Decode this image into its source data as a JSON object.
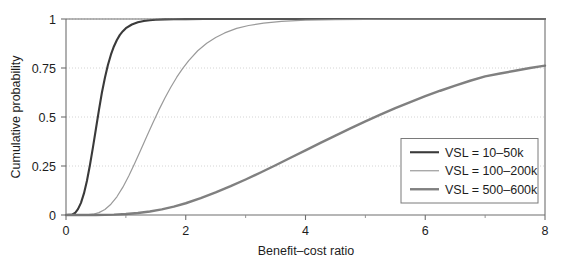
{
  "figure": {
    "background_color": "#ffffff",
    "plot_frame_color": "#6f6f6f",
    "grid_color": "#c9c9c9"
  },
  "chart_data": {
    "type": "line",
    "title": "",
    "subtitle": "",
    "xlabel": "Benefit–cost ratio",
    "ylabel": "Cumulative probability",
    "xlim": [
      0,
      8
    ],
    "ylim": [
      0,
      1
    ],
    "xticks": [
      0,
      2,
      4,
      6,
      8
    ],
    "xtick_labels": [
      "0",
      "2",
      "4",
      "6",
      "8"
    ],
    "xticks_minor": [
      1,
      3,
      5,
      7
    ],
    "yticks": [
      0,
      0.25,
      0.5,
      0.75,
      1
    ],
    "ytick_labels": [
      "0",
      "0.25",
      "0.5",
      "0.75",
      "1"
    ],
    "grid": true,
    "grid_axis": "y",
    "legend_position": "lower right",
    "series": [
      {
        "name": "VSL = 10–50k",
        "color": "#3a3a3a",
        "width": 2.1,
        "x": [
          0.0,
          0.1,
          0.15,
          0.2,
          0.25,
          0.3,
          0.35,
          0.4,
          0.45,
          0.5,
          0.55,
          0.6,
          0.65,
          0.7,
          0.75,
          0.8,
          0.85,
          0.9,
          0.95,
          1.0,
          1.1,
          1.2,
          1.3,
          1.4,
          1.5,
          1.65,
          1.8,
          2.0,
          2.3,
          2.7,
          3.2,
          4.0,
          5.0,
          6.0,
          7.0,
          8.0
        ],
        "y": [
          0.0,
          0.002,
          0.01,
          0.03,
          0.062,
          0.11,
          0.175,
          0.255,
          0.345,
          0.44,
          0.535,
          0.625,
          0.7,
          0.765,
          0.818,
          0.86,
          0.893,
          0.919,
          0.938,
          0.953,
          0.972,
          0.983,
          0.99,
          0.994,
          0.996,
          0.998,
          0.999,
          0.9995,
          0.9998,
          0.9999,
          1.0,
          1.0,
          1.0,
          1.0,
          1.0,
          1.0
        ]
      },
      {
        "name": "VSL = 100–200k",
        "color": "#9a9a9a",
        "width": 1.2,
        "x": [
          0.0,
          0.3,
          0.45,
          0.55,
          0.65,
          0.75,
          0.85,
          0.95,
          1.05,
          1.15,
          1.25,
          1.35,
          1.45,
          1.55,
          1.65,
          1.75,
          1.85,
          1.95,
          2.05,
          2.2,
          2.35,
          2.5,
          2.65,
          2.85,
          3.05,
          3.3,
          3.6,
          4.0,
          4.5,
          5.0,
          5.6,
          6.2,
          7.0,
          8.0
        ],
        "y": [
          0.0,
          0.0,
          0.004,
          0.012,
          0.028,
          0.055,
          0.093,
          0.142,
          0.2,
          0.265,
          0.333,
          0.402,
          0.47,
          0.535,
          0.596,
          0.652,
          0.703,
          0.748,
          0.788,
          0.838,
          0.876,
          0.906,
          0.929,
          0.952,
          0.967,
          0.979,
          0.988,
          0.994,
          0.997,
          0.9985,
          0.9992,
          0.9996,
          0.9998,
          1.0
        ]
      },
      {
        "name": "VSL = 500–600k",
        "color": "#808080",
        "width": 2.4,
        "x": [
          0.0,
          0.5,
          0.8,
          1.0,
          1.2,
          1.4,
          1.6,
          1.8,
          2.0,
          2.25,
          2.5,
          2.75,
          3.0,
          3.25,
          3.5,
          3.75,
          4.0,
          4.25,
          4.5,
          4.75,
          5.0,
          5.25,
          5.5,
          5.75,
          6.0,
          6.25,
          6.5,
          6.75,
          7.0,
          7.25,
          7.5,
          7.75,
          8.0
        ],
        "y": [
          0.0,
          0.0,
          0.002,
          0.005,
          0.01,
          0.018,
          0.029,
          0.043,
          0.06,
          0.086,
          0.115,
          0.147,
          0.181,
          0.217,
          0.254,
          0.292,
          0.33,
          0.368,
          0.405,
          0.442,
          0.478,
          0.512,
          0.545,
          0.576,
          0.606,
          0.634,
          0.66,
          0.685,
          0.707,
          0.722,
          0.736,
          0.75,
          0.762
        ]
      }
    ],
    "legend_entries": [
      {
        "label": "VSL = 10–50k",
        "color": "#3a3a3a",
        "width": 2.1
      },
      {
        "label": "VSL = 100–200k",
        "color": "#9a9a9a",
        "width": 1.2
      },
      {
        "label": "VSL = 500–600k",
        "color": "#808080",
        "width": 2.4
      }
    ]
  }
}
